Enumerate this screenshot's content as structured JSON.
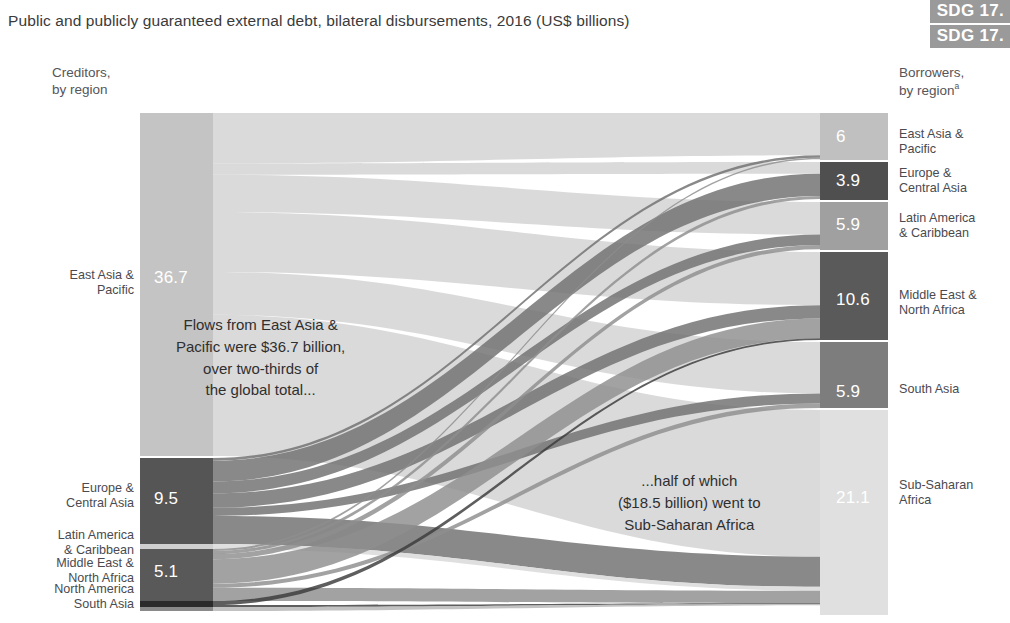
{
  "header": {
    "title": "Public and publicly guaranteed external debt, bilateral disbursements, 2016 (US$ billions)",
    "badges": [
      "SDG 17.",
      "SDG 17."
    ]
  },
  "captions": {
    "creditors_line1": "Creditors,",
    "creditors_line2": "by region",
    "borrowers_line1": "Borrowers,",
    "borrowers_line2": "by region",
    "borrowers_footnote": "a"
  },
  "annotations": {
    "left": [
      "Flows from East Asia &",
      "Pacific were $36.7 billion,",
      "over two-thirds of",
      "the global total..."
    ],
    "right": [
      "...half of which",
      "($18.5 billion) went to",
      "Sub-Saharan Africa"
    ]
  },
  "colors": {
    "node_lightest": "#e2e2e2",
    "node_light": "#c4c4c4",
    "node_medium": "#9b9b9b",
    "node_dark": "#6e6e6e",
    "node_darkest": "#4c4c4c",
    "badge": "#9a9a9a",
    "text": "#3a3a3a",
    "label_text": "#4a4a4f",
    "value_text": "#ffffff",
    "background": "#ffffff"
  },
  "chart_data": {
    "type": "sankey",
    "title": "Public and publicly guaranteed external debt, bilateral disbursements, 2016 (US$ billions)",
    "units": "US$ billions",
    "year": 2016,
    "left_axis_label": "Creditors, by region",
    "right_axis_label": "Borrowers, by region",
    "total": 53.1,
    "creditors": [
      {
        "name": "East Asia & Pacific",
        "value": 36.7,
        "value_label": "36.7",
        "color": "#c4c4c4",
        "label_lines": [
          "East Asia &",
          "Pacific"
        ]
      },
      {
        "name": "Europe & Central Asia",
        "value": 9.5,
        "value_label": "9.5",
        "color": "#555555",
        "label_lines": [
          "Europe &",
          "Central Asia"
        ]
      },
      {
        "name": "Latin America & Caribbean",
        "value": 0.4,
        "value_label": "",
        "color": "#cfcfcf",
        "label_lines": [
          "Latin America",
          "& Caribbean"
        ]
      },
      {
        "name": "Middle East & North Africa",
        "value": 5.1,
        "value_label": "5.1",
        "color": "#595959",
        "label_lines": [
          "Middle East &",
          "North Africa"
        ]
      },
      {
        "name": "North America",
        "value": 0.3,
        "value_label": "",
        "color": "#2b2b2b",
        "label_lines": [
          "North America"
        ]
      },
      {
        "name": "South Asia",
        "value": 0.1,
        "value_label": "",
        "color": "#8a8a8a",
        "label_lines": [
          "South Asia"
        ]
      }
    ],
    "borrowers": [
      {
        "name": "East Asia & Pacific",
        "value": 6.0,
        "value_label": "6",
        "color": "#c0c0c0",
        "label_lines": [
          "East Asia &",
          "Pacific"
        ]
      },
      {
        "name": "Europe & Central Asia",
        "value": 3.9,
        "value_label": "3.9",
        "color": "#4f4f4f",
        "label_lines": [
          "Europe &",
          "Central Asia"
        ]
      },
      {
        "name": "Latin America & Caribbean",
        "value": 5.9,
        "value_label": "5.9",
        "color": "#a0a0a0",
        "label_lines": [
          "Latin America",
          "& Caribbean"
        ]
      },
      {
        "name": "Middle East & North Africa",
        "value": 10.6,
        "value_label": "10.6",
        "color": "#5a5a5a",
        "label_lines": [
          "Middle East &",
          "North Africa"
        ]
      },
      {
        "name": "South Asia",
        "value": 5.9,
        "value_label": "5.9",
        "color": "#7d7d7d",
        "label_lines": [
          "South Asia"
        ]
      },
      {
        "name": "Sub-Saharan Africa",
        "value": 21.1,
        "value_label": "21.1",
        "color": "#e0e0e0",
        "label_lines": [
          "Sub-Saharan",
          "Africa"
        ]
      }
    ],
    "flows": [
      {
        "source": "East Asia & Pacific",
        "target": "East Asia & Pacific",
        "value": 5.4
      },
      {
        "source": "East Asia & Pacific",
        "target": "Europe & Central Asia",
        "value": 1.2
      },
      {
        "source": "East Asia & Pacific",
        "target": "Latin America & Caribbean",
        "value": 4.0
      },
      {
        "source": "East Asia & Pacific",
        "target": "Middle East & North Africa",
        "value": 6.4
      },
      {
        "source": "East Asia & Pacific",
        "target": "South Asia",
        "value": 4.6
      },
      {
        "source": "East Asia & Pacific",
        "target": "Sub-Saharan Africa",
        "value": 15.1
      },
      {
        "source": "Europe & Central Asia",
        "target": "East Asia & Pacific",
        "value": 0.3
      },
      {
        "source": "Europe & Central Asia",
        "target": "Europe & Central Asia",
        "value": 2.3
      },
      {
        "source": "Europe & Central Asia",
        "target": "Latin America & Caribbean",
        "value": 1.3
      },
      {
        "source": "Europe & Central Asia",
        "target": "Middle East & North Africa",
        "value": 1.6
      },
      {
        "source": "Europe & Central Asia",
        "target": "South Asia",
        "value": 0.9
      },
      {
        "source": "Europe & Central Asia",
        "target": "Sub-Saharan Africa",
        "value": 3.1
      },
      {
        "source": "Latin America & Caribbean",
        "target": "Sub-Saharan Africa",
        "value": 0.4
      },
      {
        "source": "Middle East & North Africa",
        "target": "East Asia & Pacific",
        "value": 0.2
      },
      {
        "source": "Middle East & North Africa",
        "target": "Europe & Central Asia",
        "value": 0.3
      },
      {
        "source": "Middle East & North Africa",
        "target": "Latin America & Caribbean",
        "value": 0.5
      },
      {
        "source": "Middle East & North Africa",
        "target": "Middle East & North Africa",
        "value": 2.4
      },
      {
        "source": "Middle East & North Africa",
        "target": "South Asia",
        "value": 0.4
      },
      {
        "source": "Middle East & North Africa",
        "target": "Sub-Saharan Africa",
        "value": 1.3
      },
      {
        "source": "North America",
        "target": "Middle East & North Africa",
        "value": 0.2
      },
      {
        "source": "North America",
        "target": "Sub-Saharan Africa",
        "value": 0.1
      },
      {
        "source": "South Asia",
        "target": "Sub-Saharan Africa",
        "value": 0.1
      }
    ]
  },
  "left_nodes_render": [
    {
      "value_label": "36.7",
      "y": 113,
      "h": 343,
      "color": "#c4c4c4",
      "value_y": 268,
      "label_y": 268,
      "label_lines": [
        "East Asia &",
        "Pacific"
      ]
    },
    {
      "value_label": "9.5",
      "y": 458,
      "h": 86,
      "color": "#555555",
      "value_y": 489,
      "label_y": 481,
      "label_lines": [
        "Europe &",
        "Central Asia"
      ]
    },
    {
      "value_label": "",
      "y": 544,
      "h": 5,
      "color": "#cfcfcf",
      "value_y": 0,
      "label_y": 528,
      "label_lines": [
        "Latin America",
        "& Caribbean"
      ]
    },
    {
      "value_label": "5.1",
      "y": 549,
      "h": 52,
      "color": "#595959",
      "value_y": 562,
      "label_y": 556,
      "label_lines": [
        "Middle East &",
        "North Africa"
      ]
    },
    {
      "value_label": "",
      "y": 601,
      "h": 6,
      "color": "#2b2b2b",
      "value_y": 0,
      "label_y": 582,
      "label_lines": [
        "North America"
      ]
    },
    {
      "value_label": "",
      "y": 607,
      "h": 4,
      "color": "#8a8a8a",
      "value_y": 0,
      "label_y": 597,
      "label_lines": [
        "South Asia"
      ]
    }
  ],
  "right_nodes_render": [
    {
      "value_label": "6",
      "y": 113,
      "h": 47,
      "color": "#c0c0c0",
      "value_y": 127,
      "label_y": 127,
      "label_lines": [
        "East Asia &",
        "Pacific"
      ]
    },
    {
      "value_label": "3.9",
      "y": 162,
      "h": 38,
      "color": "#4f4f4f",
      "value_y": 171,
      "label_y": 166,
      "label_lines": [
        "Europe &",
        "Central Asia"
      ]
    },
    {
      "value_label": "5.9",
      "y": 202,
      "h": 48,
      "color": "#a0a0a0",
      "value_y": 215,
      "label_y": 211,
      "label_lines": [
        "Latin America",
        "& Caribbean"
      ]
    },
    {
      "value_label": "10.6",
      "y": 252,
      "h": 88,
      "color": "#5a5a5a",
      "value_y": 290,
      "label_y": 288,
      "label_lines": [
        "Middle East &",
        "North Africa"
      ]
    },
    {
      "value_label": "5.9",
      "y": 342,
      "h": 66,
      "color": "#7d7d7d",
      "value_y": 382,
      "label_y": 382,
      "label_lines": [
        "South Asia"
      ]
    },
    {
      "value_label": "21.1",
      "y": 410,
      "h": 205,
      "color": "#e0e0e0",
      "value_y": 488,
      "label_y": 478,
      "label_lines": [
        "Sub-Saharan",
        "Africa"
      ]
    }
  ]
}
